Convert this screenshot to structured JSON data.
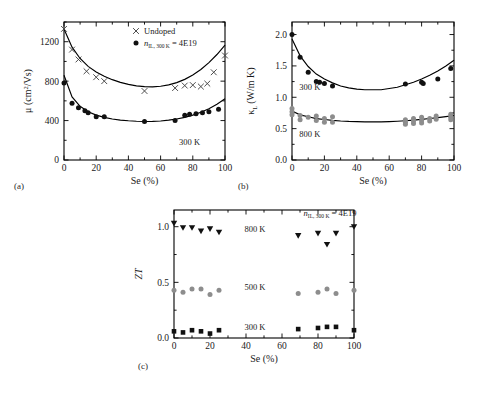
{
  "figure": {
    "panel_labels": {
      "a": "(a)",
      "b": "(b)",
      "c": "(c)"
    },
    "background_color": "#ffffff",
    "line_color": "#000000",
    "marker_dark": "#111111",
    "marker_grey": "#8d8d8d"
  },
  "chart_data": [
    {
      "type": "scatter",
      "panel": "(a)",
      "title": "",
      "xlabel": "Se (%)",
      "ylabel": "μ (cm2/Vs)",
      "ylabel_plain": "mu (cm^2/Vs)",
      "xlim": [
        0,
        100
      ],
      "ylim": [
        0,
        1400
      ],
      "xticks": [
        0,
        20,
        40,
        60,
        80,
        100
      ],
      "yticks": [
        0,
        400,
        800,
        1200
      ],
      "ytick_labels": [
        "0",
        "400",
        "800",
        "1200"
      ],
      "xtick_labels": [
        "0",
        "20",
        "40",
        "60",
        "80",
        "100"
      ],
      "grid": false,
      "annotations": [
        {
          "text": "300 K",
          "x": 78,
          "y": 150
        }
      ],
      "legend": {
        "position": "top-right",
        "entries": [
          {
            "label": "Undoped",
            "marker": "cross",
            "color": "#444444"
          },
          {
            "label": "n_IL,300K = 4E19",
            "marker": "circle",
            "color": "#111111",
            "base": "n",
            "sub": "IL, 300 K",
            "rest": " = 4E19"
          }
        ]
      },
      "series": [
        {
          "name": "Undoped",
          "marker": "cross",
          "color": "#444444",
          "points": [
            [
              0,
              1330
            ],
            [
              5,
              1120
            ],
            [
              9,
              1020
            ],
            [
              14,
              900
            ],
            [
              20,
              840
            ],
            [
              25,
              800
            ],
            [
              50,
              700
            ],
            [
              69,
              730
            ],
            [
              75,
              755
            ],
            [
              80,
              760
            ],
            [
              85,
              745
            ],
            [
              89,
              775
            ],
            [
              93,
              890
            ],
            [
              100,
              1060
            ]
          ],
          "fit_curve": [
            [
              0,
              1330
            ],
            [
              5,
              1145
            ],
            [
              10,
              1030
            ],
            [
              15,
              950
            ],
            [
              20,
              893
            ],
            [
              25,
              850
            ],
            [
              30,
              815
            ],
            [
              35,
              788
            ],
            [
              40,
              767
            ],
            [
              45,
              752
            ],
            [
              50,
              744
            ],
            [
              55,
              742
            ],
            [
              60,
              748
            ],
            [
              65,
              762
            ],
            [
              70,
              785
            ],
            [
              75,
              818
            ],
            [
              80,
              862
            ],
            [
              85,
              918
            ],
            [
              90,
              988
            ],
            [
              95,
              1070
            ],
            [
              100,
              1165
            ]
          ]
        },
        {
          "name": "n_IL,300K = 4E19",
          "marker": "circle",
          "color": "#111111",
          "points": [
            [
              0,
              780
            ],
            [
              5,
              575
            ],
            [
              9,
              530
            ],
            [
              13,
              500
            ],
            [
              15,
              480
            ],
            [
              20,
              440
            ],
            [
              25,
              440
            ],
            [
              50,
              390
            ],
            [
              69,
              400
            ],
            [
              75,
              455
            ],
            [
              78,
              465
            ],
            [
              82,
              470
            ],
            [
              86,
              480
            ],
            [
              90,
              490
            ],
            [
              96,
              515
            ]
          ],
          "fit_curve": [
            [
              0,
              860
            ],
            [
              5,
              640
            ],
            [
              10,
              545
            ],
            [
              15,
              490
            ],
            [
              20,
              455
            ],
            [
              25,
              432
            ],
            [
              30,
              416
            ],
            [
              35,
              405
            ],
            [
              40,
              398
            ],
            [
              45,
              393
            ],
            [
              50,
              391
            ],
            [
              55,
              392
            ],
            [
              60,
              396
            ],
            [
              65,
              404
            ],
            [
              70,
              416
            ],
            [
              75,
              433
            ],
            [
              80,
              455
            ],
            [
              85,
              484
            ],
            [
              90,
              520
            ],
            [
              95,
              566
            ],
            [
              100,
              622
            ]
          ]
        }
      ]
    },
    {
      "type": "scatter",
      "panel": "(b)",
      "title": "",
      "xlabel": "Se (%)",
      "ylabel": "κ_L (W/m K)",
      "ylabel_plain": "kappa_L (W/m K)",
      "xlim": [
        0,
        100
      ],
      "ylim": [
        0.0,
        2.2
      ],
      "xticks": [
        0,
        20,
        40,
        60,
        80,
        100
      ],
      "yticks": [
        0.0,
        0.5,
        1.0,
        1.5,
        2.0
      ],
      "ytick_labels": [
        "0.0",
        "0.5",
        "1.0",
        "1.5",
        "2.0"
      ],
      "xtick_labels": [
        "0",
        "20",
        "40",
        "60",
        "80",
        "100"
      ],
      "grid": false,
      "annotations": [
        {
          "text": "300 K",
          "x": 11,
          "y": 1.12
        },
        {
          "text": "800 K",
          "x": 11,
          "y": 0.37
        }
      ],
      "series": [
        {
          "name": "300 K",
          "marker": "circle",
          "color": "#111111",
          "points": [
            [
              0,
              2.0
            ],
            [
              5,
              1.64
            ],
            [
              10,
              1.4
            ],
            [
              15,
              1.25
            ],
            [
              17,
              1.24
            ],
            [
              20,
              1.22
            ],
            [
              25,
              1.18
            ],
            [
              70,
              1.21
            ],
            [
              80,
              1.24
            ],
            [
              81,
              1.22
            ],
            [
              90,
              1.29
            ],
            [
              98,
              1.46
            ]
          ],
          "fit_curve": [
            [
              0,
              1.93
            ],
            [
              5,
              1.66
            ],
            [
              10,
              1.49
            ],
            [
              15,
              1.37
            ],
            [
              20,
              1.29
            ],
            [
              25,
              1.23
            ],
            [
              30,
              1.18
            ],
            [
              35,
              1.15
            ],
            [
              40,
              1.13
            ],
            [
              45,
              1.12
            ],
            [
              50,
              1.12
            ],
            [
              55,
              1.12
            ],
            [
              60,
              1.14
            ],
            [
              65,
              1.16
            ],
            [
              70,
              1.2
            ],
            [
              75,
              1.24
            ],
            [
              80,
              1.29
            ],
            [
              85,
              1.35
            ],
            [
              90,
              1.42
            ],
            [
              95,
              1.5
            ],
            [
              100,
              1.59
            ]
          ]
        },
        {
          "name": "800 K",
          "marker": "circle",
          "color": "#8d8d8d",
          "points": [
            [
              0,
              0.82
            ],
            [
              0,
              0.77
            ],
            [
              0,
              0.72
            ],
            [
              5,
              0.71
            ],
            [
              5,
              0.64
            ],
            [
              10,
              0.68
            ],
            [
              15,
              0.7
            ],
            [
              15,
              0.63
            ],
            [
              20,
              0.66
            ],
            [
              20,
              0.6
            ],
            [
              25,
              0.69
            ],
            [
              25,
              0.6
            ],
            [
              70,
              0.64
            ],
            [
              70,
              0.6
            ],
            [
              70,
              0.57
            ],
            [
              75,
              0.66
            ],
            [
              75,
              0.62
            ],
            [
              75,
              0.58
            ],
            [
              80,
              0.68
            ],
            [
              80,
              0.63
            ],
            [
              80,
              0.59
            ],
            [
              85,
              0.66
            ],
            [
              85,
              0.62
            ],
            [
              89,
              0.7
            ],
            [
              89,
              0.65
            ],
            [
              98,
              0.73
            ],
            [
              98,
              0.68
            ],
            [
              98,
              0.64
            ]
          ],
          "fit_curve": [
            [
              0,
              0.78
            ],
            [
              5,
              0.72
            ],
            [
              10,
              0.69
            ],
            [
              15,
              0.66
            ],
            [
              20,
              0.645
            ],
            [
              25,
              0.632
            ],
            [
              30,
              0.622
            ],
            [
              35,
              0.615
            ],
            [
              40,
              0.611
            ],
            [
              45,
              0.608
            ],
            [
              50,
              0.607
            ],
            [
              55,
              0.608
            ],
            [
              60,
              0.612
            ],
            [
              65,
              0.618
            ],
            [
              70,
              0.626
            ],
            [
              75,
              0.636
            ],
            [
              80,
              0.648
            ],
            [
              85,
              0.661
            ],
            [
              90,
              0.676
            ],
            [
              95,
              0.692
            ],
            [
              100,
              0.71
            ]
          ]
        }
      ]
    },
    {
      "type": "scatter",
      "panel": "(c)",
      "title": "",
      "xlabel": "Se (%)",
      "ylabel": "ZT",
      "xlim": [
        0,
        100
      ],
      "ylim": [
        0.0,
        1.15
      ],
      "xticks": [
        0,
        20,
        40,
        60,
        80,
        100
      ],
      "yticks": [
        0.0,
        0.5,
        1.0
      ],
      "ytick_labels": [
        "0.0",
        "0.5",
        "1.0"
      ],
      "xtick_labels": [
        "0",
        "20",
        "40",
        "60",
        "80",
        "100"
      ],
      "grid": false,
      "annotations": [
        {
          "text": "800 K",
          "x": 45,
          "y": 0.95
        },
        {
          "text": "500 K",
          "x": 45,
          "y": 0.43
        },
        {
          "text": "300 K",
          "x": 45,
          "y": 0.07
        },
        {
          "text": "n_IL,300K = 4E19",
          "x": 72,
          "y": 1.1,
          "base": "n",
          "sub": "IL, 300 K",
          "rest": " = 4E19"
        }
      ],
      "series": [
        {
          "name": "800 K",
          "marker": "triangle-down",
          "color": "#111111",
          "points": [
            [
              0,
              1.03
            ],
            [
              5,
              0.99
            ],
            [
              10,
              0.99
            ],
            [
              15,
              0.96
            ],
            [
              20,
              0.98
            ],
            [
              25,
              0.95
            ],
            [
              69,
              0.92
            ],
            [
              80,
              0.94
            ],
            [
              85,
              0.84
            ],
            [
              90,
              0.94
            ],
            [
              100,
              1.0
            ]
          ]
        },
        {
          "name": "500 K",
          "marker": "circle",
          "color": "#8d8d8d",
          "points": [
            [
              0,
              0.43
            ],
            [
              5,
              0.41
            ],
            [
              10,
              0.44
            ],
            [
              15,
              0.44
            ],
            [
              20,
              0.39
            ],
            [
              25,
              0.43
            ],
            [
              69,
              0.4
            ],
            [
              80,
              0.41
            ],
            [
              85,
              0.44
            ],
            [
              90,
              0.4
            ],
            [
              100,
              0.43
            ]
          ]
        },
        {
          "name": "300 K",
          "marker": "square",
          "color": "#111111",
          "points": [
            [
              0,
              0.06
            ],
            [
              5,
              0.05
            ],
            [
              10,
              0.07
            ],
            [
              15,
              0.06
            ],
            [
              20,
              0.04
            ],
            [
              25,
              0.07
            ],
            [
              69,
              0.08
            ],
            [
              80,
              0.09
            ],
            [
              85,
              0.1
            ],
            [
              90,
              0.1
            ],
            [
              100,
              0.07
            ]
          ]
        }
      ]
    }
  ]
}
